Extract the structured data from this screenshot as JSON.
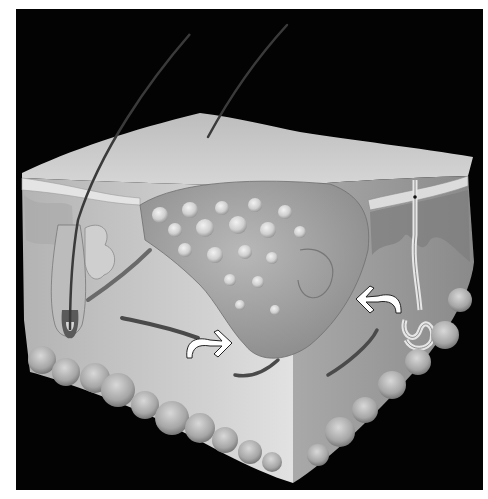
{
  "figure": {
    "background_color": "#030303",
    "margin_color": "#ffffff",
    "skin_colors": {
      "surface": "#c9c9c9",
      "epidermis_band": "#dcdcdc",
      "dermis_left": "#bdbdbd",
      "dermis_right": "#8e8e8e",
      "lesion": "#9a9a9a",
      "lesion_nodules": "#e6e6e6",
      "fat_lobules": "#a8a8a8",
      "vessel": "#4a4a4a",
      "hair": "#3a3a3a"
    },
    "annotations": [
      {
        "name": "arrow-right",
        "direction": "right",
        "color": "#ffffff"
      },
      {
        "name": "arrow-left",
        "direction": "left",
        "color": "#ffffff"
      }
    ],
    "structures": [
      "hair-shaft-left",
      "hair-shaft-right",
      "hair-follicle",
      "sebaceous-gland",
      "arrector-pili-muscle",
      "sweat-gland",
      "dermal-lesion",
      "blood-vessels",
      "subcutaneous-fat"
    ]
  }
}
